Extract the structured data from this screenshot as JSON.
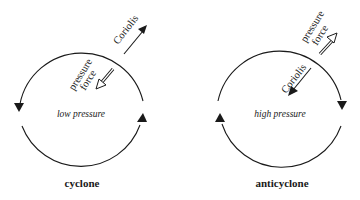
{
  "colors": {
    "stroke": "#1a1a1a",
    "background": "#ffffff"
  },
  "panels": [
    {
      "id": "cyclone",
      "caption": "cyclone",
      "center_label": "low pressure",
      "rotation": "counterclockwise",
      "forces": [
        {
          "name": "Coriolis",
          "label": "Coriolis",
          "direction": "outward",
          "arrow_style": "solid"
        },
        {
          "name": "pressure force",
          "label_line1": "pressure",
          "label_line2": "force",
          "direction": "inward",
          "arrow_style": "hollow"
        }
      ]
    },
    {
      "id": "anticyclone",
      "caption": "anticyclone",
      "center_label": "high pressure",
      "rotation": "clockwise",
      "forces": [
        {
          "name": "Coriolis",
          "label": "Coriolis",
          "direction": "inward",
          "arrow_style": "solid"
        },
        {
          "name": "pressure force",
          "label_line1": "pressure",
          "label_line2": "force",
          "direction": "outward",
          "arrow_style": "hollow"
        }
      ]
    }
  ]
}
